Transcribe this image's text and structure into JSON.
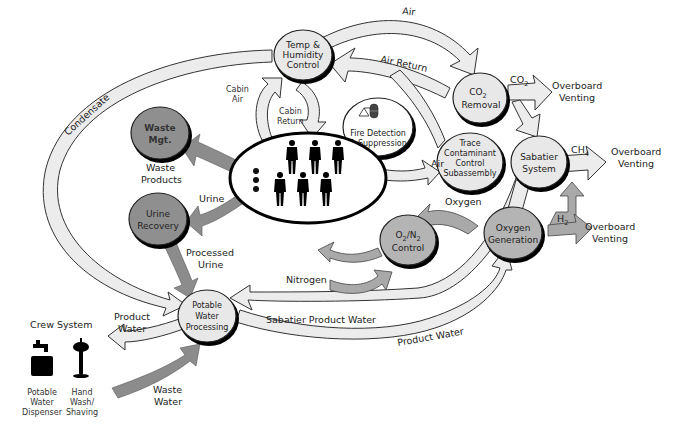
{
  "diagram": {
    "colors": {
      "light_node": "#e8e8e8",
      "mid_node": "#b4b4b4",
      "dark_node": "#8f8f8f",
      "light_flow": "#ececec",
      "mid_flow": "#a9a9a9",
      "dark_flow": "#8c8c8c",
      "outline": "#222222"
    },
    "nodes": {
      "temp_humidity": [
        "Temp &",
        "Humidity",
        "Control"
      ],
      "co2_removal": {
        "line1_main": "CO",
        "line1_sub": "2",
        "line2": "Removal"
      },
      "fire_detection": [
        "Fire Detection",
        "& Suppression"
      ],
      "trace_contaminant": [
        "Trace",
        "Contaminant",
        "Control",
        "Subassembly"
      ],
      "sabatier": [
        "Sabatier",
        "System"
      ],
      "waste_mgt": [
        "Waste",
        "Mgt."
      ],
      "urine_recovery": [
        "Urine",
        "Recovery"
      ],
      "o2n2_control": {
        "o": "O",
        "o_sub": "2",
        "slash": "/N",
        "n_sub": "2",
        "line2": "Control"
      },
      "oxygen_generation": [
        "Oxygen",
        "Generation"
      ],
      "potable_water": [
        "Potable",
        "Water",
        "Processing"
      ]
    },
    "flows": {
      "air": "Air",
      "air_return": "Air Return",
      "co2_main": "CO",
      "co2_sub": "2",
      "ch4_main": "CH",
      "ch4_sub": "4",
      "h2_main": "H",
      "h2_sub": "2",
      "overboard_venting_1": [
        "Overboard",
        "Venting"
      ],
      "overboard_venting_2": [
        "Overboard",
        "Venting"
      ],
      "overboard_venting_3": [
        "Overboard",
        "Venting"
      ],
      "cabin_air": [
        "Cabin",
        "Air"
      ],
      "cabin_return": [
        "Cabin",
        "Return"
      ],
      "condensate": "Condensate",
      "waste_products": [
        "Waste",
        "Products"
      ],
      "urine": "Urine",
      "air_to_trace": "Air",
      "oxygen": "Oxygen",
      "nitrogen": "Nitrogen",
      "processed_urine": [
        "Processed",
        "Urine"
      ],
      "product_water_left": [
        "Product",
        "Water"
      ],
      "sabatier_product_water": "Sabatier Product Water",
      "product_water_bottom": "Product Water",
      "waste_water": [
        "Waste",
        "Water"
      ]
    },
    "crew_system": {
      "title": "Crew System",
      "items": [
        {
          "label": [
            "Potable",
            "Water",
            "Dispenser"
          ],
          "icon": "faucet-icon"
        },
        {
          "label": [
            "Hand",
            "Wash/",
            "Shaving"
          ],
          "icon": "hand-wash-icon"
        }
      ]
    },
    "crew_count": 6
  }
}
